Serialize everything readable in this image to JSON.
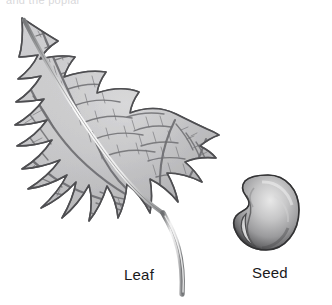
{
  "figure": {
    "kind": "botanical-illustration",
    "cropped_header_text": "and the poplar",
    "colors": {
      "background": "#ffffff",
      "ink_dark": "#4a4a4c",
      "ink_mid": "#8d8d90",
      "ink_light": "#c9c9cb",
      "label_text": "#19191b",
      "vein_line": "#6f6f72",
      "seed_rim": "#3d3d3f",
      "seed_body": "#b3b3b5",
      "seed_highlight": "#e6e6e6"
    }
  },
  "specimens": [
    {
      "id": "leaf",
      "label": "Leaf",
      "description": "Broadly triangular-ovate leaf with crenate margin, palmate venation, pale midrib and long curved petiole"
    },
    {
      "id": "seed",
      "label": "Seed",
      "description": "Rounded reniform seed with notched hilum at lower left and graded shading"
    }
  ],
  "labels": {
    "leaf": "Leaf",
    "seed": "Seed"
  },
  "icons": {
    "leaf": "leaf-illustration",
    "seed": "seed-illustration"
  }
}
